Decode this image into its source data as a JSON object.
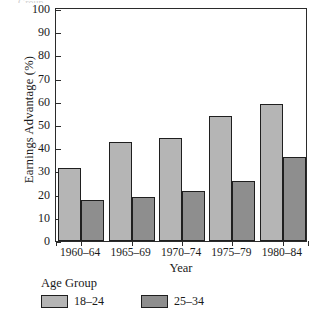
{
  "chart_data": {
    "type": "bar",
    "title": "",
    "xlabel": "Year",
    "ylabel": "Earnings Advantage (%)",
    "ylim": [
      0,
      100
    ],
    "yticks": [
      0,
      10,
      20,
      30,
      40,
      50,
      60,
      70,
      80,
      90,
      100
    ],
    "grid": false,
    "legend_position": "bottom-left",
    "legend_title": "Age Group",
    "categories": [
      "1960–64",
      "1965–69",
      "1970–74",
      "1975–79",
      "1980–84"
    ],
    "series": [
      {
        "name": "18–24",
        "color": "#b5b5b5",
        "values": [
          31.5,
          42.5,
          44.5,
          54.0,
          59.0
        ]
      },
      {
        "name": "25–34",
        "color": "#8e8e8e",
        "values": [
          17.5,
          19.0,
          21.5,
          26.0,
          36.0
        ]
      }
    ]
  },
  "axes": {
    "y_label": "Earnings Advantage (%)",
    "x_label": "Year",
    "y_tick_labels": [
      "100",
      "90",
      "80",
      "70",
      "60",
      "50",
      "40",
      "30",
      "20",
      "10",
      "0"
    ],
    "x_tick_labels": [
      "1960–64",
      "1965–69",
      "1970–74",
      "1975–79",
      "1980–84"
    ]
  },
  "legend": {
    "title": "Age Group",
    "items": [
      {
        "label": "18–24",
        "color": "#b5b5b5"
      },
      {
        "label": "25–34",
        "color": "#8e8e8e"
      }
    ]
  },
  "colors": {
    "series_light": "#b5b5b5",
    "series_dark": "#8e8e8e",
    "axis": "#2b2b2b",
    "bar_outline": "#1f1f1f",
    "background": "#ffffff"
  },
  "artifacts": {
    "top_clip_text": "Group"
  }
}
